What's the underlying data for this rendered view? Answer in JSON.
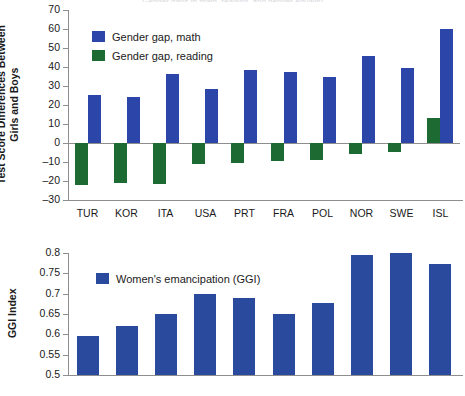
{
  "figure": {
    "title_clipped": "Gender gaps in math, reading, and gender equality"
  },
  "chart_data": [
    {
      "type": "bar",
      "id": "test-score-differences",
      "title": "",
      "xlabel": "",
      "ylabel": "Test Score Differences Between\nGirls and Boys",
      "categories": [
        "TUR",
        "KOR",
        "ITA",
        "USA",
        "PRT",
        "FRA",
        "POL",
        "NOR",
        "SWE",
        "ISL"
      ],
      "ylim": [
        -30,
        70
      ],
      "yticks": [
        70,
        60,
        50,
        40,
        30,
        20,
        10,
        0,
        -10,
        -20,
        -30
      ],
      "ytick_labels": [
        "70",
        "60",
        "50",
        "40",
        "30",
        "20",
        "10",
        "0",
        "–10",
        "–20",
        "–30"
      ],
      "grid": false,
      "legend_position": "upper-left",
      "series": [
        {
          "name": "Gender gap, math",
          "color": "#2b46a8",
          "values": [
            25,
            24,
            36.5,
            28.5,
            38.5,
            37.5,
            34.5,
            46,
            39.5,
            60
          ]
        },
        {
          "name": "Gender gap, reading",
          "color": "#1d6b33",
          "values": [
            -22,
            -21,
            -21.5,
            -11,
            -10.5,
            -9.5,
            -9,
            -6,
            -4.5,
            13
          ]
        }
      ]
    },
    {
      "type": "bar",
      "id": "ggi-index",
      "title": "",
      "xlabel": "",
      "ylabel": "GGI Index",
      "categories": [
        "TUR",
        "KOR",
        "ITA",
        "USA",
        "PRT",
        "FRA",
        "POL",
        "NOR",
        "SWE",
        "ISL"
      ],
      "ylim": [
        0.5,
        0.8
      ],
      "yticks": [
        0.8,
        0.75,
        0.7,
        0.65,
        0.6,
        0.55,
        0.5
      ],
      "ytick_labels": [
        "0.8",
        "0.75",
        "0.7",
        "0.65",
        "0.6",
        "0.55",
        "0.5"
      ],
      "grid": false,
      "legend_position": "upper-left",
      "series": [
        {
          "name": "Women's emancipation (GGI)",
          "color": "#2a4a9e",
          "values": [
            0.595,
            0.62,
            0.65,
            0.698,
            0.689,
            0.649,
            0.678,
            0.795,
            0.8,
            0.773
          ]
        }
      ]
    }
  ]
}
